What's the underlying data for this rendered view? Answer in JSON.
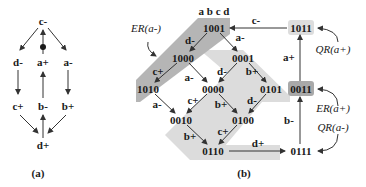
{
  "panel_a": {
    "caption": "(a)",
    "nodes": {
      "c_minus": "c-",
      "d_minus": "d-",
      "a_plus": "a+",
      "a_minus": "a-",
      "c_plus": "c+",
      "b_minus": "b-",
      "b_plus": "b+",
      "d_plus": "d+"
    }
  },
  "panel_b": {
    "caption": "(b)",
    "header": "a b c d",
    "states": {
      "s1001": "1001",
      "s1000": "1000",
      "s0001": "0001",
      "s1010": "1010",
      "s0000": "0000",
      "s0101": "0101",
      "s0010": "0010",
      "s0100": "0100",
      "s0110": "0110",
      "s0111": "0111",
      "s0011": "0011",
      "s1011": "1011"
    },
    "edge_labels": {
      "e1001_1000": "d-",
      "e1001_0001": "a-",
      "e1000_1010": "c+",
      "e1000_0000": "a-",
      "e0001_0000": "d-",
      "e0001_0101": "b+",
      "e1010_0010": "a-",
      "e0000_0010": "c+",
      "e0000_0100": "b+",
      "e0101_0100": "d-",
      "e0010_0110": "b+",
      "e0100_0110": "c+",
      "e0110_0111": "d+",
      "e0111_0011": "b-",
      "e0011_1011": "a+",
      "e1011_1001": "c-"
    },
    "annotations": {
      "er_a_minus": "ER(a-)",
      "qr_a_plus": "QR(a+)",
      "er_a_plus": "ER(a+)",
      "qr_a_minus": "QR(a-)"
    },
    "colors": {
      "dark_region": "#b5b5b5",
      "light_region": "#dcdcdc",
      "node_highlight_dark": "#a9a9a9",
      "node_highlight_light": "#dddddd"
    }
  }
}
